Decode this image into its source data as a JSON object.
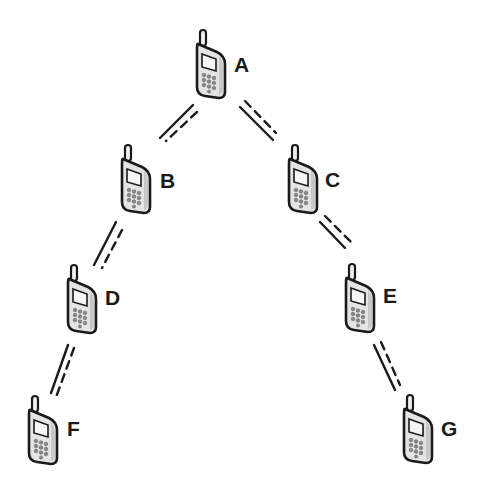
{
  "diagram": {
    "type": "tree",
    "colors": {
      "background": "#ffffff",
      "outline": "#1a1a1a",
      "phone_body": "#e4e4e4",
      "phone_screen": "#f4f4f4",
      "keypad": "#8a8a8a",
      "label": "#1a1a1a"
    },
    "nodes": [
      {
        "id": "A",
        "label": "A",
        "icon": "mobile-phone-icon",
        "x": 195,
        "y": 30,
        "label_x": 234,
        "label_y": 54
      },
      {
        "id": "B",
        "label": "B",
        "icon": "mobile-phone-icon",
        "x": 120,
        "y": 145,
        "label_x": 160,
        "label_y": 170
      },
      {
        "id": "C",
        "label": "C",
        "icon": "mobile-phone-icon",
        "x": 287,
        "y": 145,
        "label_x": 325,
        "label_y": 169
      },
      {
        "id": "D",
        "label": "D",
        "icon": "mobile-phone-icon",
        "x": 66,
        "y": 265,
        "label_x": 105,
        "label_y": 287
      },
      {
        "id": "E",
        "label": "E",
        "icon": "mobile-phone-icon",
        "x": 344,
        "y": 264,
        "label_x": 383,
        "label_y": 285
      },
      {
        "id": "F",
        "label": "F",
        "icon": "mobile-phone-icon",
        "x": 27,
        "y": 396,
        "label_x": 67,
        "label_y": 418
      },
      {
        "id": "G",
        "label": "G",
        "icon": "mobile-phone-icon",
        "x": 402,
        "y": 395,
        "label_x": 441,
        "label_y": 418
      }
    ],
    "edges": [
      {
        "from": "A",
        "to": "B",
        "solid": [
          193,
          105,
          160,
          138
        ],
        "dashed": [
          197,
          112,
          166,
          141
        ]
      },
      {
        "from": "A",
        "to": "C",
        "solid": [
          240,
          107,
          273,
          140
        ],
        "dashed": [
          245,
          101,
          276,
          133
        ]
      },
      {
        "from": "B",
        "to": "D",
        "solid": [
          116,
          222,
          94,
          265
        ],
        "dashed": [
          122,
          230,
          102,
          268
        ]
      },
      {
        "from": "C",
        "to": "E",
        "solid": [
          320,
          222,
          345,
          248
        ],
        "dashed": [
          325,
          216,
          352,
          243
        ]
      },
      {
        "from": "D",
        "to": "F",
        "solid": [
          68,
          345,
          51,
          393
        ],
        "dashed": [
          74,
          348,
          55,
          400
        ]
      },
      {
        "from": "E",
        "to": "G",
        "solid": [
          374,
          345,
          395,
          390
        ],
        "dashed": [
          381,
          342,
          400,
          385
        ]
      }
    ]
  }
}
